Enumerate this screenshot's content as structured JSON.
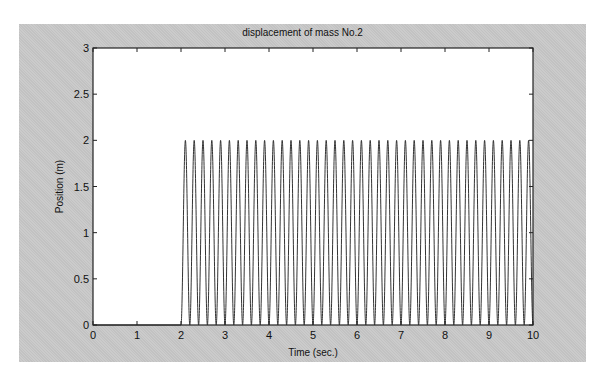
{
  "chart_data": {
    "type": "line",
    "title": "displacement of mass No.2",
    "xlabel": "Time (sec.)",
    "ylabel": "Position (m)",
    "xlim": [
      0,
      10
    ],
    "ylim": [
      0,
      3
    ],
    "x_ticks": [
      "0",
      "1",
      "2",
      "3",
      "4",
      "5",
      "6",
      "7",
      "8",
      "9",
      "10"
    ],
    "y_ticks": [
      "0",
      "0.5",
      "1",
      "1.5",
      "2",
      "2.5",
      "3"
    ],
    "grid": false,
    "legend": null,
    "series": [
      {
        "name": "mass No.2 position",
        "description": "Zero until t=2 s, then oscillates between 0 and 2 m with ~0.2 s period (~5 Hz), ~40 peaks through t=10 s",
        "model": "y = 0 for t<2; y = 1 - cos(2*pi*5*(t-2)) for t>=2",
        "start_time": 2,
        "frequency_hz": 5,
        "min": 0,
        "max": 2,
        "color": "#333333"
      }
    ]
  }
}
